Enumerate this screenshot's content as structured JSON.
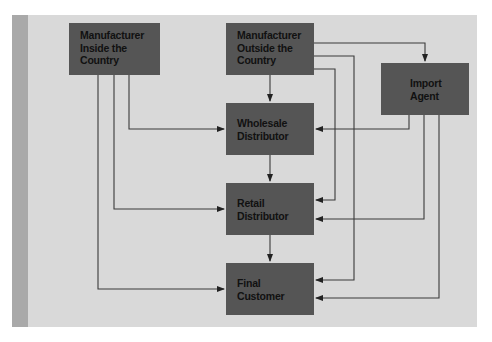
{
  "diagram": {
    "type": "flowchart",
    "title": "",
    "colors": {
      "panel": "#d9d9d9",
      "strip": "#a9a9a9",
      "node_fill": "#555555",
      "node_text": "#111111",
      "edge": "#333333"
    },
    "nodes": [
      {
        "id": "mfr_inside",
        "lines": [
          "Manufacturer",
          "Inside the",
          "Country"
        ]
      },
      {
        "id": "mfr_outside",
        "lines": [
          "Manufacturer",
          "Outside the",
          "Country"
        ]
      },
      {
        "id": "import_agent",
        "lines": [
          "Import",
          "Agent"
        ]
      },
      {
        "id": "wholesale",
        "lines": [
          "Wholesale",
          "Distributor"
        ]
      },
      {
        "id": "retail",
        "lines": [
          "Retail",
          "Distributor"
        ]
      },
      {
        "id": "final_customer",
        "lines": [
          "Final",
          "Customer"
        ]
      }
    ],
    "edges": [
      {
        "from": "mfr_inside",
        "to": "wholesale"
      },
      {
        "from": "mfr_inside",
        "to": "retail"
      },
      {
        "from": "mfr_inside",
        "to": "final_customer"
      },
      {
        "from": "mfr_outside",
        "to": "wholesale"
      },
      {
        "from": "mfr_outside",
        "to": "import_agent"
      },
      {
        "from": "mfr_outside",
        "to": "retail"
      },
      {
        "from": "mfr_outside",
        "to": "final_customer"
      },
      {
        "from": "import_agent",
        "to": "wholesale"
      },
      {
        "from": "import_agent",
        "to": "retail"
      },
      {
        "from": "import_agent",
        "to": "final_customer"
      },
      {
        "from": "wholesale",
        "to": "retail"
      },
      {
        "from": "retail",
        "to": "final_customer"
      }
    ]
  }
}
